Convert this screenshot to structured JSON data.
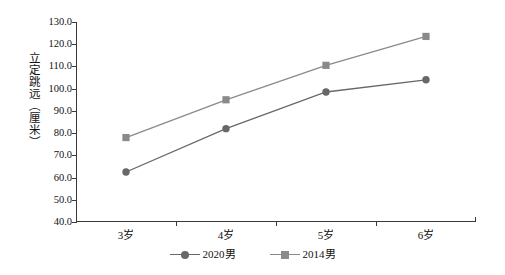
{
  "chart_data": {
    "type": "line",
    "title": "",
    "xlabel": "",
    "ylabel": "立定跳远（厘米）",
    "categories": [
      "3岁",
      "4岁",
      "5岁",
      "6岁"
    ],
    "ylim": [
      40.0,
      130.0
    ],
    "ytick_step": 10.0,
    "ytick_labels": [
      "130.0",
      "120.0",
      "110.0",
      "100.0",
      "90.0",
      "80.0",
      "70.0",
      "60.0",
      "50.0",
      "40.0"
    ],
    "grid": false,
    "legend_position": "bottom",
    "series": [
      {
        "name": "2020男",
        "marker": "circle",
        "color": "#686868",
        "values": [
          62.5,
          82.0,
          98.5,
          104.0
        ]
      },
      {
        "name": "2014男",
        "marker": "square",
        "color": "#8a8a8a",
        "values": [
          78.0,
          95.0,
          110.5,
          123.5
        ]
      }
    ]
  },
  "axis": {
    "line_color": "#3a3a3a"
  }
}
